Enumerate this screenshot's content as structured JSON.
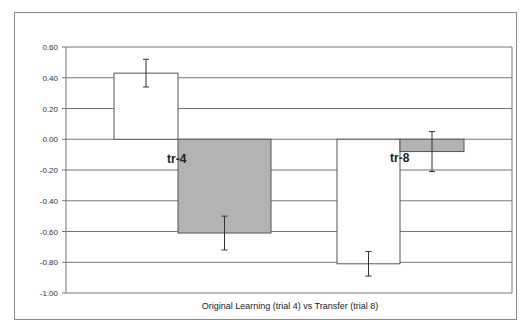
{
  "chart_data": {
    "type": "bar",
    "title": "",
    "xlabel": "Original Learning (trial 4) vs Transfer (trial 8)",
    "ylabel": "",
    "ylim": [
      -1.0,
      0.6
    ],
    "yticks": [
      "0.60",
      "0.40",
      "0.20",
      "0.00",
      "-0.20",
      "-0.40",
      "-0.60",
      "-0.80",
      "-1.00"
    ],
    "grid": true,
    "legend": null,
    "categories": [
      "tr-4",
      "tr-8"
    ],
    "series": [
      {
        "name": "white",
        "color": "#ffffff",
        "values": [
          0.43,
          -0.81
        ],
        "error": [
          0.09,
          0.08
        ]
      },
      {
        "name": "gray",
        "color": "#b3b3b3",
        "values": [
          -0.61,
          -0.08
        ],
        "error": [
          0.11,
          0.13
        ]
      }
    ],
    "annotations": [
      "tr-4",
      "tr-8"
    ]
  }
}
